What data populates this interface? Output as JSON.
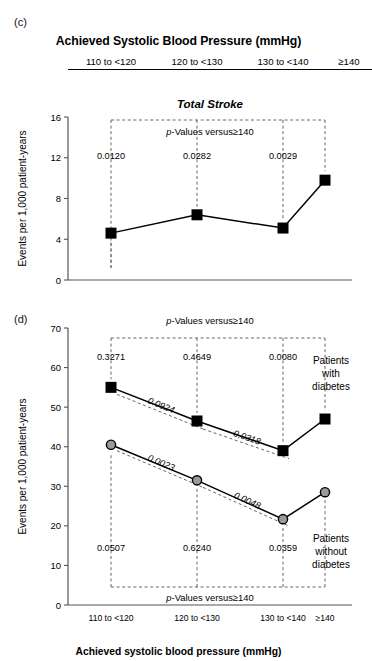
{
  "figure": {
    "panel_c_letter": "(c)",
    "panel_d_letter": "(d)",
    "top_header": "Achieved Systolic Blood Pressure (mmHg)",
    "bottom_axis_title": "Achieved systolic blood pressure (mmHg)",
    "categories": [
      "110 to <120",
      "120 to <130",
      "130 to <140",
      "≥140"
    ],
    "y_axis_label": "Events per 1,000 patient-years",
    "pvalue_header": "p-Values versus≥140",
    "pvalue_header_italic_p": "p",
    "pvalue_header_rest": "-Values versus≥140",
    "colors": {
      "line": "#000000",
      "marker_filled": "#000000",
      "marker_open_fill": "#9a9a9a",
      "marker_open_stroke": "#000000",
      "dashed": "#666666",
      "axis": "#555555"
    }
  },
  "chart_data": [
    {
      "type": "line",
      "panel": "(c)",
      "title": "Total Stroke",
      "xlabel": "Achieved Systolic Blood Pressure (mmHg)",
      "ylabel": "Events per 1,000 patient-years",
      "categories": [
        "110 to <120",
        "120 to <130",
        "130 to <140",
        "≥140"
      ],
      "ylim": [
        0,
        16
      ],
      "yticks": [
        0,
        4,
        8,
        12,
        16
      ],
      "grid": false,
      "legend": "none",
      "series": [
        {
          "name": "Total Stroke",
          "marker": "filled-square",
          "values": [
            4.6,
            6.4,
            5.1,
            9.8
          ]
        }
      ],
      "annotations": {
        "pvalue_header": "p-Values versus≥140",
        "pvalues_vs_140": [
          "0.0120",
          "0.0282",
          "0.0029"
        ]
      }
    },
    {
      "type": "line",
      "panel": "(d)",
      "title": "",
      "xlabel": "Achieved systolic blood pressure (mmHg)",
      "ylabel": "Events per 1,000 patient-years",
      "categories": [
        "110 to <120",
        "120 to <130",
        "130 to <140",
        "≥140"
      ],
      "ylim": [
        0,
        70
      ],
      "yticks": [
        0,
        10,
        20,
        30,
        40,
        50,
        60,
        70
      ],
      "grid": false,
      "legend": "inline-labels-right",
      "series": [
        {
          "name": "Patients with diabetes",
          "marker": "filled-square",
          "values": [
            55.0,
            46.5,
            39.0,
            47.0
          ],
          "label_lines": [
            "Patients",
            "with",
            "diabetes"
          ]
        },
        {
          "name": "Patients without diabetes",
          "marker": "open-circle",
          "values": [
            40.5,
            31.5,
            21.7,
            28.5
          ],
          "label_lines": [
            "Patients",
            "without",
            "diabetes"
          ]
        }
      ],
      "annotations": {
        "pvalue_header_top": "p-Values versus≥140",
        "pvalue_header_bottom": "p-Values versus≥140",
        "pvalues_diabetes_vs_140": [
          "0.3271",
          "0.4649",
          "0.0080"
        ],
        "pvalues_nodiabetes_vs_140": [
          "0.0507",
          "0.6240",
          "0.0359"
        ],
        "pvalues_between_groups": [
          "0.0924",
          "0.0318"
        ],
        "pvalues_between_groups_lower": [
          "0.0023",
          "0.0048"
        ]
      }
    }
  ]
}
